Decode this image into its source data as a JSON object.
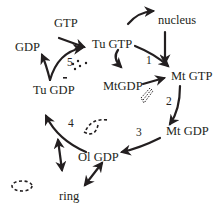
{
  "diagram": {
    "type": "cycle",
    "nodes": {
      "gtp": "GTP",
      "gdp": "GDP",
      "nucleus": "nucleus",
      "tu_gtp": "Tu GTP",
      "mt_gtp": "Mt GTP",
      "mtgdp": "MtGDP",
      "tu_gdp": "Tu GDP",
      "mt_gdp": "Mt GDP",
      "ol_gdp": "Ol GDP",
      "ring": "ring"
    },
    "steps": {
      "s1": "1",
      "s2": "2",
      "s3": "3",
      "s4": "4",
      "s5": "5"
    },
    "edges": [
      {
        "from": "Tu GTP",
        "to": "Mt GTP",
        "label": "1"
      },
      {
        "from": "nucleus",
        "to": "Mt GTP"
      },
      {
        "from": "Tu GTP",
        "to": "nucleus"
      },
      {
        "from": "Tu GTP",
        "to": "MtGDP"
      },
      {
        "from": "MtGDP",
        "to": "Mt GTP"
      },
      {
        "from": "Mt GTP",
        "to": "Mt GDP",
        "label": "2"
      },
      {
        "from": "Mt GDP",
        "to": "Ol GDP",
        "label": "3"
      },
      {
        "from": "Ol GDP",
        "to": "Tu GDP",
        "label": "4"
      },
      {
        "from": "Tu GDP",
        "to": "Tu GTP",
        "label": "5"
      },
      {
        "from": "Tu GDP",
        "to": "GDP"
      },
      {
        "from": "GTP",
        "to": "Tu GTP"
      },
      {
        "from": "Ol GDP",
        "to": "ring",
        "bidirectional": true
      },
      {
        "from": "Tu GDP",
        "to": "Ol GDP",
        "bidirectional": true
      }
    ],
    "colors": {
      "ink": "#231f20",
      "background": "#ffffff"
    }
  }
}
